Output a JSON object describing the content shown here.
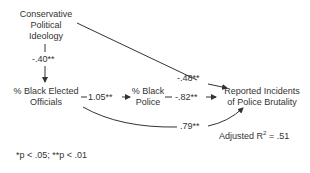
{
  "nodes": {
    "ideology": {
      "line1": "Conservative",
      "line2": "Political",
      "line3": "Ideology"
    },
    "elected": {
      "line1": "% Black Elected",
      "line2": "Officials"
    },
    "police": {
      "line1": "% Black",
      "line2": "Police"
    },
    "brutality": {
      "line1": "Reported Incidents",
      "line2": "of Police Brutality"
    }
  },
  "paths": {
    "ideology_to_elected": "-.40**",
    "ideology_to_brutality": "-.48**",
    "elected_to_police": "1.05**",
    "police_to_brutality": "-.82**",
    "elected_to_brutality": ".79**"
  },
  "fit": {
    "label": "Adjusted R",
    "sup": "2",
    "value": " = .51"
  },
  "footnote": "*p < .05; **p < .01",
  "colors": {
    "line": "#333333",
    "text": "#333333"
  }
}
